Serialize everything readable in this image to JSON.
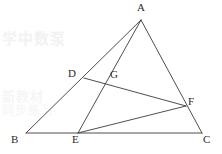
{
  "figure": {
    "width": 222,
    "height": 154,
    "background_color": "#ffffff",
    "line_color": "#3a3a3a",
    "label_color": "#2b2b2b"
  },
  "labels": {
    "A": "A",
    "B": "B",
    "C": "C",
    "D": "D",
    "E": "E",
    "F": "F",
    "G": "G"
  },
  "watermarks": {
    "top": "学中数泵",
    "mid": "新教材",
    "mid2": "同步练习"
  },
  "chart_data": {
    "type": "diagram",
    "points": [
      {
        "name": "A",
        "x": 141,
        "y": 20,
        "label_x": 137,
        "label_y": 2,
        "role": "apex-vertex"
      },
      {
        "name": "B",
        "x": 26,
        "y": 133,
        "label_x": 11,
        "label_y": 134,
        "role": "base-left-vertex"
      },
      {
        "name": "C",
        "x": 202,
        "y": 133,
        "label_x": 203,
        "label_y": 134,
        "role": "base-right-vertex"
      },
      {
        "name": "D",
        "x": 84,
        "y": 78,
        "label_x": 68,
        "label_y": 68,
        "role": "point-on-AB"
      },
      {
        "name": "E",
        "x": 78,
        "y": 133,
        "label_x": 72,
        "label_y": 134,
        "role": "point-on-BC"
      },
      {
        "name": "F",
        "x": 186,
        "y": 106,
        "label_x": 188,
        "label_y": 96,
        "role": "point-on-AC"
      },
      {
        "name": "G",
        "x": 107,
        "y": 80,
        "label_x": 110,
        "label_y": 69,
        "role": "intersection-AE-DF"
      }
    ],
    "segments": [
      {
        "name": "AB",
        "from": "A",
        "to": "B"
      },
      {
        "name": "BC",
        "from": "B",
        "to": "C"
      },
      {
        "name": "CA",
        "from": "C",
        "to": "A"
      },
      {
        "name": "AE",
        "from": "A",
        "to": "E"
      },
      {
        "name": "DF",
        "from": "D",
        "to": "F"
      },
      {
        "name": "EF",
        "from": "E",
        "to": "F"
      }
    ],
    "xlabel": "",
    "ylabel": "",
    "grid": false,
    "legend": false
  }
}
